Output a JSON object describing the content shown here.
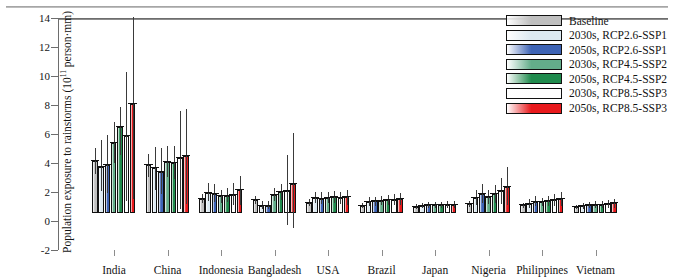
{
  "chart_data": {
    "type": "bar",
    "title": "",
    "xlabel": "",
    "ylabel": "Population exposure to rainstorms (10¹¹ person·mm)",
    "ylabel_prefix": "Population exposure to rainstorms (10",
    "ylabel_exponent": "11",
    "ylabel_suffix": " person·mm)",
    "ylim": [
      -2,
      14
    ],
    "yticks": [
      -2,
      0,
      2,
      4,
      6,
      8,
      10,
      12,
      14
    ],
    "grid": false,
    "legend_position": "top-right",
    "error_bars": "whisker with mean marker",
    "categories": [
      "India",
      "China",
      "Indonesia",
      "Bangladesh",
      "USA",
      "Brazil",
      "Japan",
      "Nigeria",
      "Philippines",
      "Vietnam"
    ],
    "series": [
      {
        "name": "Baseline",
        "color": "#bfbfbf",
        "values": [
          3.6,
          3.3,
          1.0,
          0.9,
          0.72,
          0.5,
          0.44,
          0.62,
          0.52,
          0.4
        ],
        "err_low": [
          2.7,
          2.45,
          0.72,
          0.62,
          0.5,
          0.33,
          0.3,
          0.4,
          0.34,
          0.26
        ],
        "err_high": [
          4.45,
          4.1,
          1.3,
          1.18,
          0.96,
          0.68,
          0.6,
          0.86,
          0.72,
          0.56
        ]
      },
      {
        "name": "2030s, RCP2.6-SSP1",
        "color": "#dce9f1",
        "values": [
          3.2,
          3.1,
          1.35,
          0.5,
          1.05,
          0.78,
          0.5,
          1.05,
          0.64,
          0.46
        ],
        "err_low": [
          1.55,
          1.6,
          0.8,
          0.28,
          0.68,
          0.5,
          0.32,
          0.58,
          0.38,
          0.28
        ],
        "err_high": [
          5.05,
          4.55,
          2.05,
          0.8,
          1.48,
          1.08,
          0.7,
          1.62,
          0.96,
          0.68
        ]
      },
      {
        "name": "2050s, RCP2.6-SSP1",
        "color": "#3d63b5",
        "values": [
          3.3,
          2.85,
          1.3,
          0.5,
          1.0,
          0.8,
          0.52,
          1.3,
          0.78,
          0.52
        ],
        "err_low": [
          1.35,
          1.3,
          0.78,
          0.26,
          0.62,
          0.5,
          0.34,
          0.68,
          0.46,
          0.32
        ],
        "err_high": [
          5.35,
          4.45,
          2.0,
          0.82,
          1.42,
          1.12,
          0.74,
          2.0,
          1.14,
          0.76
        ]
      },
      {
        "name": "2030s, RCP4.5-SSP2",
        "color": "#63ad8a",
        "values": [
          4.85,
          3.55,
          1.15,
          1.25,
          1.06,
          0.86,
          0.52,
          1.1,
          0.74,
          0.56
        ],
        "err_low": [
          3.45,
          2.5,
          0.72,
          0.82,
          0.68,
          0.56,
          0.34,
          0.62,
          0.46,
          0.36
        ],
        "err_high": [
          6.25,
          4.65,
          1.62,
          1.72,
          1.48,
          1.18,
          0.74,
          1.62,
          1.06,
          0.8
        ]
      },
      {
        "name": "2050s, RCP4.5-SSP2",
        "color": "#1f8a4c",
        "values": [
          5.9,
          3.45,
          1.2,
          1.45,
          1.1,
          0.9,
          0.54,
          1.3,
          0.8,
          0.58
        ],
        "err_low": [
          4.0,
          2.35,
          0.76,
          0.9,
          0.7,
          0.58,
          0.34,
          0.72,
          0.5,
          0.36
        ],
        "err_high": [
          7.3,
          4.6,
          1.7,
          2.02,
          1.54,
          1.24,
          0.76,
          1.94,
          1.14,
          0.84
        ]
      },
      {
        "name": "2030s, RCP8.5-SSP3",
        "color": "#fdfdfd",
        "values": [
          5.3,
          3.8,
          1.25,
          1.55,
          1.02,
          0.92,
          0.56,
          1.52,
          0.88,
          0.62
        ],
        "err_low": [
          0.8,
          0.25,
          0.55,
          -0.85,
          0.62,
          0.52,
          0.34,
          0.62,
          0.5,
          0.38
        ],
        "err_high": [
          9.75,
          7.05,
          2.05,
          4.0,
          1.48,
          1.3,
          0.8,
          2.4,
          1.3,
          0.9
        ]
      },
      {
        "name": "2050s, RCP8.5-SSP3",
        "color": "#e8191c",
        "values": [
          7.5,
          3.9,
          1.6,
          2.0,
          1.08,
          0.96,
          0.58,
          1.78,
          0.94,
          0.66
        ],
        "err_low": [
          0.95,
          0.6,
          0.52,
          -1.05,
          0.56,
          0.52,
          0.32,
          0.52,
          0.46,
          0.36
        ],
        "err_high": [
          13.55,
          7.15,
          2.55,
          5.5,
          1.62,
          1.4,
          0.84,
          3.15,
          1.42,
          1.0
        ]
      }
    ]
  },
  "legend": {
    "items": [
      {
        "label": "Baseline",
        "color": "#bfbfbf"
      },
      {
        "label": "2030s, RCP2.6-SSP1",
        "color": "#dce9f1"
      },
      {
        "label": "2050s, RCP2.6-SSP1",
        "color": "#3d63b5"
      },
      {
        "label": "2030s, RCP4.5-SSP2",
        "color": "#63ad8a"
      },
      {
        "label": "2050s, RCP4.5-SSP2",
        "color": "#1f8a4c"
      },
      {
        "label": "2030s, RCP8.5-SSP3",
        "color": "#fdfdfd"
      },
      {
        "label": "2050s, RCP8.5-SSP3",
        "color": "#e8191c"
      }
    ]
  }
}
